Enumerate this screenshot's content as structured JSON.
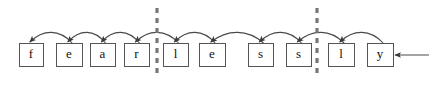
{
  "figure": {
    "title": "",
    "word": "fearlessly",
    "cells": [
      {
        "label": "f",
        "x": 19,
        "y": 43,
        "w": 24,
        "h": 23
      },
      {
        "label": "e",
        "x": 56,
        "y": 43,
        "w": 26,
        "h": 23
      },
      {
        "label": "a",
        "x": 90,
        "y": 43,
        "w": 25,
        "h": 23
      },
      {
        "label": "r",
        "x": 124,
        "y": 43,
        "w": 25,
        "h": 23
      },
      {
        "label": "l",
        "x": 163,
        "y": 43,
        "w": 25,
        "h": 23
      },
      {
        "label": "e",
        "x": 199,
        "y": 43,
        "w": 26,
        "h": 23
      },
      {
        "label": "s",
        "x": 248,
        "y": 43,
        "w": 25,
        "h": 23
      },
      {
        "label": "s",
        "x": 286,
        "y": 43,
        "w": 25,
        "h": 23
      },
      {
        "label": "l",
        "x": 328,
        "y": 43,
        "w": 26,
        "h": 23
      },
      {
        "label": "y",
        "x": 367,
        "y": 43,
        "w": 26,
        "h": 23
      }
    ],
    "arcs": [
      {
        "from_cell": 1,
        "to_cell": 0
      },
      {
        "from_cell": 2,
        "to_cell": 1
      },
      {
        "from_cell": 3,
        "to_cell": 2
      },
      {
        "from_cell": 4,
        "to_cell": 3
      },
      {
        "from_cell": 5,
        "to_cell": 4
      },
      {
        "from_cell": 6,
        "to_cell": 5
      },
      {
        "from_cell": 7,
        "to_cell": 6
      },
      {
        "from_cell": 8,
        "to_cell": 7
      },
      {
        "from_cell": 9,
        "to_cell": 8
      }
    ],
    "boundaries": [
      {
        "name": "segment-boundary-1",
        "x": 157,
        "y1": 8,
        "y2": 78
      },
      {
        "name": "segment-boundary-2",
        "x": 317,
        "y1": 8,
        "y2": 78
      }
    ],
    "pointer": {
      "name": "current-position-pointer",
      "x_start": 429,
      "x_end": 395,
      "y": 55
    },
    "colors": {
      "box_stroke": "#555555",
      "box_fill": "#ffffff",
      "arc_stroke": "#4a4a4a",
      "boundary_stroke": "#777777",
      "text": "#111111",
      "background": "#ffffff"
    }
  }
}
